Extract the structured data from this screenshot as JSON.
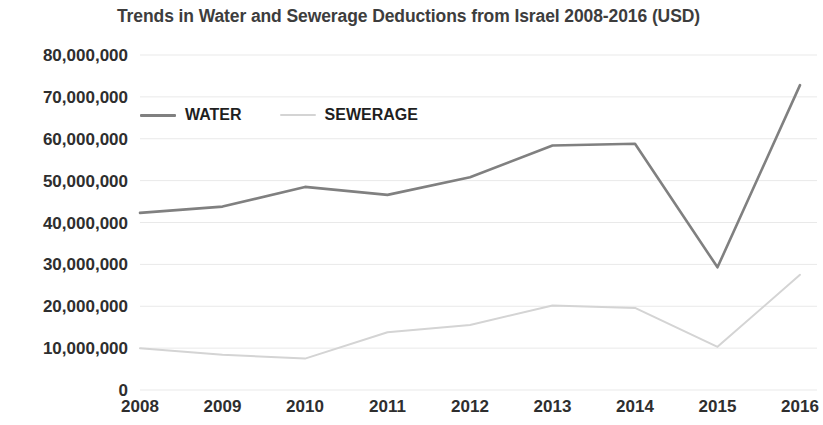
{
  "chart_data": {
    "type": "line",
    "title": "Trends in Water and Sewerage Deductions from Israel 2008-2016 (USD)",
    "xlabel": "",
    "ylabel": "",
    "categories": [
      "2008",
      "2009",
      "2010",
      "2011",
      "2012",
      "2013",
      "2014",
      "2015",
      "2016"
    ],
    "series": [
      {
        "name": "WATER",
        "color": "#808080",
        "values": [
          42300000,
          43800000,
          48500000,
          46600000,
          50800000,
          58400000,
          58800000,
          29300000,
          72800000
        ]
      },
      {
        "name": "SEWERAGE",
        "color": "#d4d4d4",
        "values": [
          10000000,
          8400000,
          7500000,
          13800000,
          15500000,
          20200000,
          19600000,
          10300000,
          27500000
        ]
      }
    ],
    "ylim": [
      0,
      80000000
    ],
    "ytick_values": [
      0,
      10000000,
      20000000,
      30000000,
      40000000,
      50000000,
      60000000,
      70000000,
      80000000
    ],
    "ytick_labels": [
      "0",
      "10,000,000",
      "20,000,000",
      "30,000,000",
      "40,000,000",
      "50,000,000",
      "60,000,000",
      "70,000,000",
      "80,000,000"
    ],
    "grid": true,
    "grid_color": "#e9e9e9",
    "legend_position": "top-left",
    "background": "#ffffff"
  },
  "legend": {
    "entries": [
      {
        "label": "WATER"
      },
      {
        "label": "SEWERAGE"
      }
    ]
  }
}
